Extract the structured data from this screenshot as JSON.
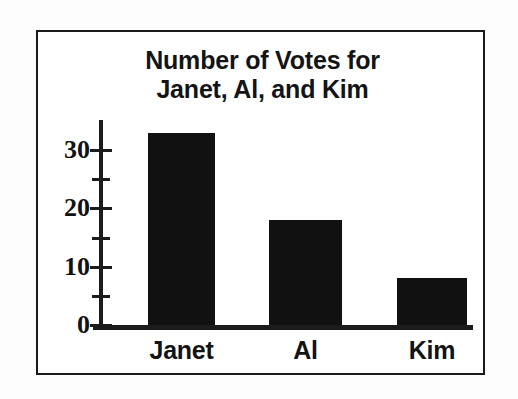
{
  "chart_data": {
    "type": "bar",
    "title": "Number of Votes for Janet, Al, and Kim",
    "title_lines": [
      "Number of Votes for",
      "Janet, Al, and Kim"
    ],
    "categories": [
      "Janet",
      "Al",
      "Kim"
    ],
    "values": [
      33,
      18,
      8
    ],
    "xlabel": "",
    "ylabel": "",
    "ylim": [
      0,
      35
    ],
    "y_major_ticks": [
      0,
      10,
      20,
      30
    ],
    "y_minor_ticks": [
      5,
      15,
      25
    ],
    "y_tick_labels": [
      "0",
      "10",
      "20",
      "30"
    ],
    "grid": false,
    "legend": null,
    "bar_color": "#111111",
    "axis_color": "#1b1b1b",
    "border_color": "#1a1a1a",
    "background_color": "#ffffff"
  },
  "bars": [
    {
      "label": "Janet",
      "value": 33
    },
    {
      "label": "Al",
      "value": 18
    },
    {
      "label": "Kim",
      "value": 8
    }
  ],
  "y_axis": {
    "ticks": [
      {
        "label": "30",
        "value": 30,
        "major": true
      },
      {
        "label": "",
        "value": 25,
        "major": false
      },
      {
        "label": "20",
        "value": 20,
        "major": true
      },
      {
        "label": "",
        "value": 15,
        "major": false
      },
      {
        "label": "10",
        "value": 10,
        "major": true
      },
      {
        "label": "",
        "value": 5,
        "major": false
      },
      {
        "label": "0",
        "value": 0,
        "major": true
      }
    ]
  }
}
